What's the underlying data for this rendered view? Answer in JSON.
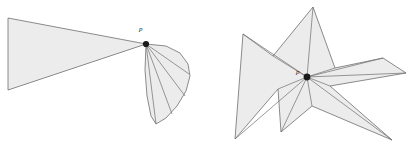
{
  "figure": {
    "canvas": {
      "width": 409,
      "height": 149
    },
    "background_color": "#ffffff",
    "fill_color": "#ececec",
    "stroke_color": "#6f6f6f",
    "dot_color": "#1a1a1a"
  },
  "left_figure": {
    "name": "wedge-with-fan",
    "label": "p",
    "label_position": {
      "x": 139,
      "y": 31
    },
    "apex": {
      "x": 146,
      "y": 44
    },
    "wedge_polygon": "8,18 146,44 8,90",
    "fan_segments": [
      "146,44 166,46 181,54 188,64 189,75 185,89 176,104 165,117 156,124",
      "146,44 170,51 182,63 186,77 182,93 172,109 160,121",
      "146,44 174,60 183,76 180,93 170,110 158,122",
      "146,44 178,72 181,88 174,105 160,121"
    ],
    "fan_rays": [
      "146,44 189,74",
      "146,44 185,96",
      "146,44 172,114",
      "146,44 156,124"
    ],
    "fan_outline": "146,44 166,46 180,53 188,64 190,76 186,91 177,106 166,118 156,124 151,116 147,96 145,70"
  },
  "right_figure": {
    "name": "star-shaped-polygon",
    "label": "p",
    "label_position": {
      "x": 296,
      "y": 74
    },
    "kernel_point": {
      "x": 307,
      "y": 77
    },
    "outline": "313,7 335,68 383,58 406,73 330,86 392,140 312,106 281,132 278,89 235,139 243,34 273,56",
    "diagonals": [
      "307,77 313,7",
      "307,77 335,68",
      "307,77 383,58",
      "307,77 406,73",
      "307,77 330,86",
      "307,77 392,140",
      "307,77 312,106",
      "307,77 281,132",
      "307,77 278,89",
      "307,77 235,139",
      "307,77 243,34",
      "307,77 273,56"
    ]
  }
}
